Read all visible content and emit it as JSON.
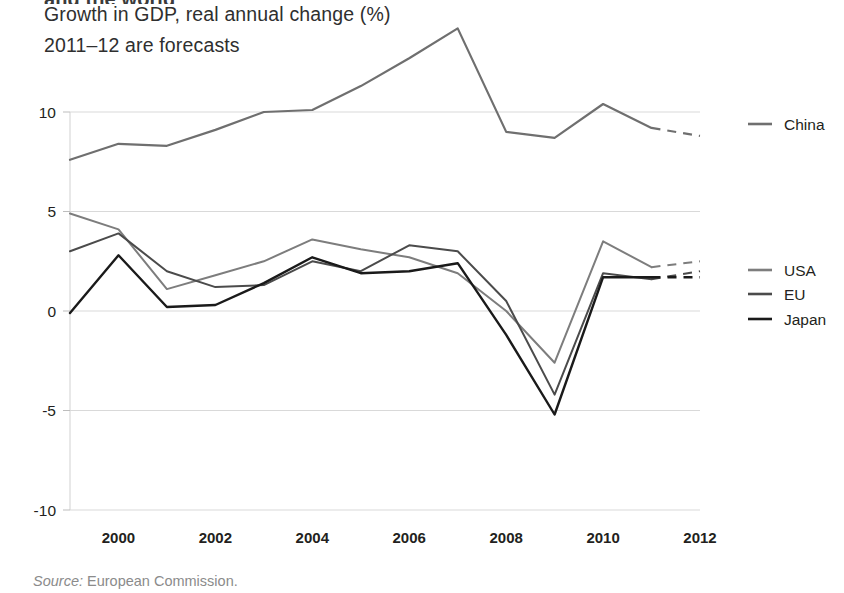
{
  "header": {
    "cut_off_line": "and the world",
    "title_line_1": "Growth in GDP, real annual change (%)",
    "title_line_2": "2011–12 are forecasts"
  },
  "footer": {
    "source_label": "Source:",
    "source_text": "European Commission."
  },
  "colors": {
    "china": "#6f6f6f",
    "usa": "#7d7d7d",
    "eu": "#4b4b4b",
    "japan": "#1a1a1a",
    "gridline": "#d9d9d9",
    "text": "#231f20",
    "source_text": "#8b8b8b"
  },
  "chart_data": {
    "type": "line",
    "title": "Growth in GDP, real annual change (%)",
    "subtitle": "2011–12 are forecasts",
    "xlabel": "",
    "ylabel": "",
    "x": [
      1999,
      2000,
      2001,
      2002,
      2003,
      2004,
      2005,
      2006,
      2007,
      2008,
      2009,
      2010,
      2011,
      2012
    ],
    "xlim": [
      1999,
      2012
    ],
    "ylim": [
      -10,
      14.5
    ],
    "yticks": [
      10,
      5,
      0,
      -5,
      -10
    ],
    "ytick_labels": [
      "10",
      "5",
      "0",
      "-5",
      "-10"
    ],
    "xticks": [
      2000,
      2002,
      2004,
      2006,
      2008,
      2010,
      2012
    ],
    "xtick_labels": [
      "2000",
      "2002",
      "2004",
      "2006",
      "2008",
      "2010",
      "2012"
    ],
    "grid": true,
    "grid_axis": "y",
    "legend_position": "right",
    "forecast_from": 2011,
    "forecast_style": "dashed",
    "series": [
      {
        "name": "China",
        "color": "#6f6f6f",
        "width": 2.2,
        "values": [
          7.6,
          8.4,
          8.3,
          9.1,
          10.0,
          10.1,
          11.3,
          12.7,
          14.2,
          9.0,
          8.7,
          10.4,
          9.2,
          8.8
        ]
      },
      {
        "name": "USA",
        "color": "#7d7d7d",
        "width": 2.0,
        "values": [
          4.9,
          4.1,
          1.1,
          1.8,
          2.5,
          3.6,
          3.1,
          2.7,
          1.9,
          0.0,
          -2.6,
          3.5,
          2.2,
          2.5
        ]
      },
      {
        "name": "EU",
        "color": "#4b4b4b",
        "width": 2.0,
        "values": [
          3.0,
          3.9,
          2.0,
          1.2,
          1.3,
          2.5,
          2.0,
          3.3,
          3.0,
          0.5,
          -4.2,
          1.9,
          1.6,
          2.0
        ]
      },
      {
        "name": "Japan",
        "color": "#1a1a1a",
        "width": 2.4,
        "values": [
          -0.1,
          2.8,
          0.2,
          0.3,
          1.4,
          2.7,
          1.9,
          2.0,
          2.4,
          -1.2,
          -5.2,
          1.7,
          1.7,
          1.7
        ]
      }
    ],
    "legend_entries": [
      {
        "label": "China",
        "color": "#6f6f6f",
        "y": 124
      },
      {
        "label": "USA",
        "color": "#7d7d7d",
        "y": 270
      },
      {
        "label": "EU",
        "color": "#4b4b4b",
        "y": 294
      },
      {
        "label": "Japan",
        "color": "#1a1a1a",
        "y": 319
      }
    ]
  }
}
